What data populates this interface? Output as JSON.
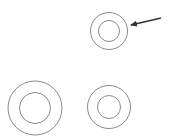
{
  "canvas": {
    "width": 173,
    "height": 138,
    "background": "#ffffff"
  },
  "colors": {
    "circle_stroke": "#8a8a8a",
    "arrow_stroke": "#333333"
  },
  "rings": [
    {
      "name": "ring-top-right",
      "cx": 109,
      "cy": 31,
      "outer_r": 18.5,
      "inner_r": 10.5,
      "highlighted": true
    },
    {
      "name": "ring-bottom-left",
      "cx": 35,
      "cy": 108,
      "outer_r": 27,
      "inner_r": 15.5,
      "highlighted": false
    },
    {
      "name": "ring-bottom-right",
      "cx": 109,
      "cy": 107,
      "outer_r": 21.5,
      "inner_r": 11.5,
      "highlighted": false
    }
  ],
  "arrow": {
    "x1": 161,
    "y1": 18,
    "x2": 131,
    "y2": 25,
    "points_to": "ring-top-right"
  }
}
